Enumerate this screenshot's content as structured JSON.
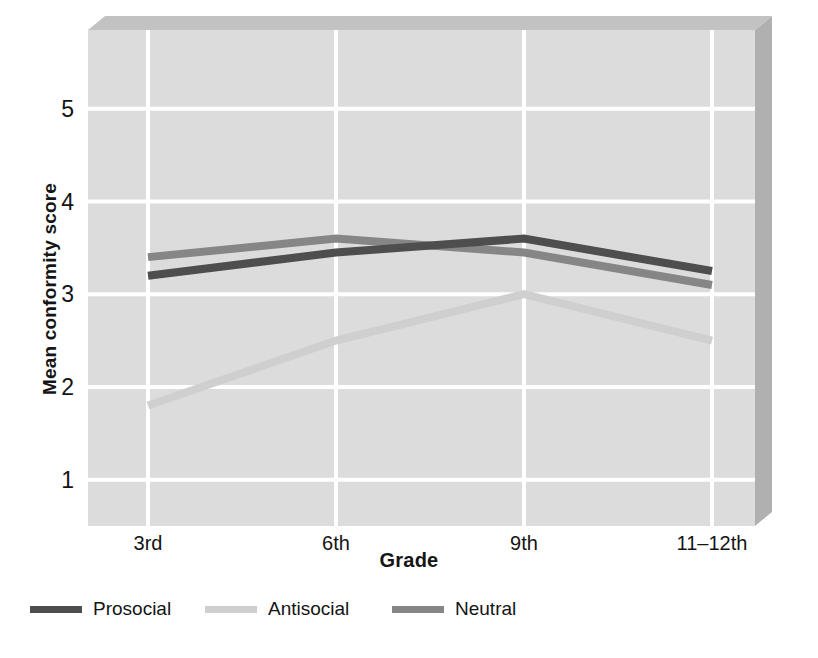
{
  "chart_data": {
    "type": "line",
    "title": "",
    "xlabel": "Grade",
    "ylabel": "Mean conformity score",
    "categories": [
      "3rd",
      "6th",
      "9th",
      "11–12th"
    ],
    "yticks": [
      "1",
      "2",
      "3",
      "4",
      "5"
    ],
    "ytick_values": [
      1,
      2,
      3,
      4,
      5
    ],
    "ylim": [
      0.5,
      5.85
    ],
    "grid": true,
    "legend_position": "bottom",
    "series": [
      {
        "name": "Prosocial",
        "color": "#4e4e4e",
        "values": [
          3.2,
          3.45,
          3.6,
          3.25
        ]
      },
      {
        "name": "Antisocial",
        "color": "#cfcfcf",
        "values": [
          1.8,
          2.5,
          3.0,
          2.5
        ]
      },
      {
        "name": "Neutral",
        "color": "#868686",
        "values": [
          3.4,
          3.6,
          3.45,
          3.1
        ]
      }
    ]
  },
  "style": {
    "plot_background": "#dcdcdc",
    "gridline_color": "#ffffff",
    "wall_shadow_color": "#b4b4b4",
    "bevel_color": "#c4c4c4",
    "page_background": "#ffffff",
    "text_color": "#141414"
  },
  "legend": {
    "items": [
      {
        "label": "Prosocial",
        "color": "#4e4e4e"
      },
      {
        "label": "Antisocial",
        "color": "#cfcfcf"
      },
      {
        "label": "Neutral",
        "color": "#868686"
      }
    ]
  },
  "axes": {
    "x_title": "Grade",
    "y_title": "Mean conformity score"
  }
}
